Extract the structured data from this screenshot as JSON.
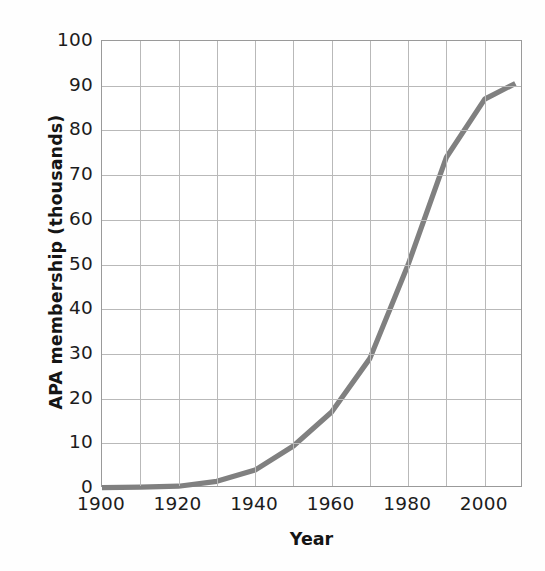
{
  "chart_data": {
    "type": "line",
    "title": "",
    "xlabel": "Year",
    "ylabel": "APA membership (thousands)",
    "xlim": [
      1900,
      2010
    ],
    "ylim": [
      0,
      100
    ],
    "grid": true,
    "legend": "none",
    "line_color": "#808080",
    "grid_color": "#b9b9b9",
    "frame_color": "#9a9a9a",
    "xticks": [
      1900,
      1920,
      1940,
      1960,
      1980,
      2000
    ],
    "xtick_labels": [
      "1900",
      "1920",
      "1940",
      "1960",
      "1980",
      "2000"
    ],
    "x_minor_ticks": [
      1910,
      1930,
      1950,
      1970,
      1990,
      2010
    ],
    "yticks": [
      0,
      10,
      20,
      30,
      40,
      50,
      60,
      70,
      80,
      90,
      100
    ],
    "ytick_labels": [
      "0",
      "10",
      "20",
      "30",
      "40",
      "50",
      "60",
      "70",
      "80",
      "90",
      "100"
    ],
    "series": [
      {
        "name": "APA membership",
        "x": [
          1900,
          1910,
          1920,
          1930,
          1940,
          1950,
          1960,
          1970,
          1980,
          1990,
          2000,
          2008
        ],
        "values": [
          0.1,
          0.2,
          0.4,
          1.5,
          4.0,
          9.4,
          17.0,
          29.0,
          50.0,
          74.0,
          87.0,
          90.5
        ]
      }
    ]
  }
}
